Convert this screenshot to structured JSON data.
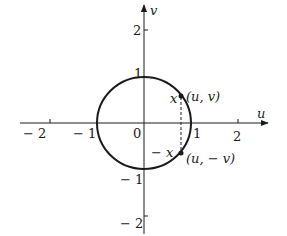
{
  "figure": {
    "axes": {
      "horizontal_label": "u",
      "vertical_label": "v",
      "origin_label": "0",
      "h_ticks": [
        {
          "value": -2,
          "label": "− 2"
        },
        {
          "value": -1,
          "label": "− 1"
        },
        {
          "value": 1,
          "label": "1"
        },
        {
          "value": 2,
          "label": "2"
        }
      ],
      "v_ticks": [
        {
          "value": 2,
          "label": "2"
        },
        {
          "value": 1,
          "label": "1"
        },
        {
          "value": -1,
          "label": "− 1"
        },
        {
          "value": -2,
          "label": "− 2"
        }
      ]
    },
    "circle": {
      "center": [
        0,
        0
      ],
      "radius": 1
    },
    "points": [
      {
        "label": "(u, v)",
        "side_label": "x"
      },
      {
        "label": "(u, − v)",
        "side_label": "− x"
      }
    ],
    "colors": {
      "ink": "#1a1a1a",
      "background": "#ffffff"
    }
  }
}
